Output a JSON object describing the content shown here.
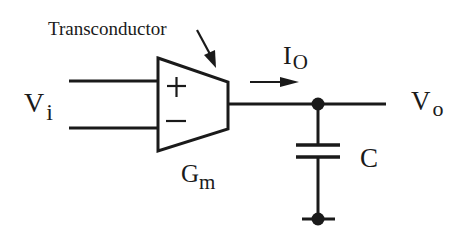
{
  "diagram": {
    "type": "circuit",
    "labels": {
      "transconductor": "Transconductor",
      "vin_main": "V",
      "vin_sub": "i",
      "plus": "+",
      "minus": "−",
      "gm_main": "G",
      "gm_sub": "m",
      "io_main": "I",
      "io_sub": "O",
      "vo_main": "V",
      "vo_sub": "o",
      "cap": "C"
    },
    "components": [
      {
        "id": "transconductor",
        "kind": "OTA amplifier (trapezoid)",
        "inputs": [
          "+",
          "-"
        ],
        "parameter": "Gm"
      },
      {
        "id": "capacitor",
        "kind": "capacitor",
        "label": "C"
      }
    ],
    "nodes": [
      "Vi (differential input)",
      "Vo (output node)",
      "ground"
    ],
    "annotations": [
      "Io current arrow pointing right",
      "arrow pointing to Transconductor"
    ],
    "colors": {
      "ink": "#1a1a1a",
      "background": "#ffffff"
    }
  }
}
